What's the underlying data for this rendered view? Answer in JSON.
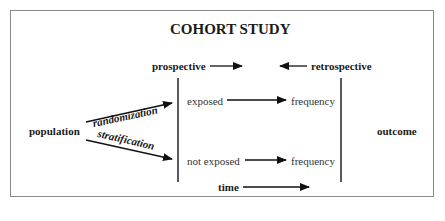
{
  "title": "COHORT STUDY",
  "labels": {
    "prospective": "prospective",
    "retrospective": "retrospective",
    "population": "population",
    "randomization": "randomization",
    "stratification": "stratification",
    "exposed": "exposed",
    "not_exposed": "not exposed",
    "frequency_top": "frequency",
    "frequency_bottom": "frequency",
    "outcome": "outcome",
    "time": "time"
  },
  "colors": {
    "line": "#111111",
    "frame": "#8a8a8a",
    "text": "#1a1a1a"
  }
}
